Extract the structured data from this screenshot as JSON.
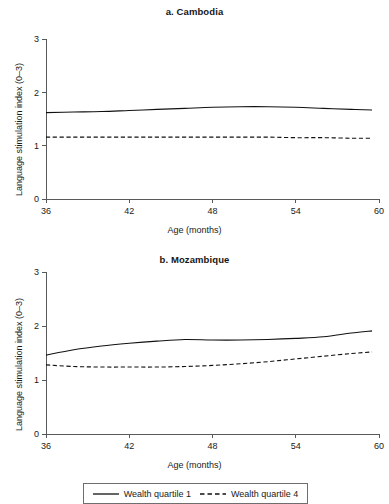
{
  "figure": {
    "legend": {
      "entries": [
        {
          "label": "Wealth quartile 1",
          "style": "solid"
        },
        {
          "label": "Wealth quartile 4",
          "style": "dashed"
        }
      ]
    }
  },
  "chart_data": [
    {
      "type": "line",
      "title": "a. Cambodia",
      "xlabel": "Age (months)",
      "ylabel": "Language stimulation index (0–3)",
      "xlim": [
        36,
        60
      ],
      "ylim": [
        0,
        3
      ],
      "xticks": [
        36,
        42,
        48,
        54,
        60
      ],
      "yticks": [
        0,
        1,
        2,
        3
      ],
      "grid": false,
      "legend_position": "bottom",
      "x": [
        36,
        38,
        40,
        42,
        44,
        46,
        48,
        50,
        52,
        54,
        56,
        58,
        59.5
      ],
      "series": [
        {
          "name": "Wealth quartile 1",
          "style": "solid",
          "values": [
            1.62,
            1.63,
            1.64,
            1.66,
            1.68,
            1.7,
            1.72,
            1.73,
            1.73,
            1.72,
            1.7,
            1.68,
            1.67
          ]
        },
        {
          "name": "Wealth quartile 4",
          "style": "dashed",
          "values": [
            1.16,
            1.16,
            1.16,
            1.16,
            1.16,
            1.16,
            1.16,
            1.16,
            1.16,
            1.15,
            1.15,
            1.14,
            1.14
          ]
        }
      ]
    },
    {
      "type": "line",
      "title": "b. Mozambique",
      "xlabel": "Age (months)",
      "ylabel": "Language stimulation index (0–3)",
      "xlim": [
        36,
        60
      ],
      "ylim": [
        0,
        3
      ],
      "xticks": [
        36,
        42,
        48,
        54,
        60
      ],
      "yticks": [
        0,
        1,
        2,
        3
      ],
      "grid": false,
      "legend_position": "bottom",
      "x": [
        36,
        38,
        40,
        42,
        44,
        46,
        48,
        50,
        52,
        54,
        56,
        58,
        59.5
      ],
      "series": [
        {
          "name": "Wealth quartile 1",
          "style": "solid",
          "values": [
            1.46,
            1.56,
            1.63,
            1.68,
            1.72,
            1.75,
            1.74,
            1.74,
            1.75,
            1.77,
            1.8,
            1.87,
            1.91
          ]
        },
        {
          "name": "Wealth quartile 4",
          "style": "dashed",
          "values": [
            1.28,
            1.25,
            1.24,
            1.24,
            1.24,
            1.25,
            1.27,
            1.3,
            1.34,
            1.39,
            1.44,
            1.49,
            1.52
          ]
        }
      ]
    }
  ]
}
